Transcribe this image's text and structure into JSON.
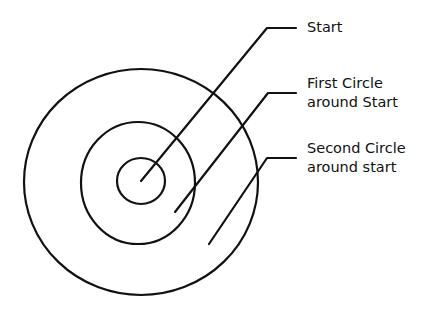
{
  "diagram": {
    "type": "concentric-circles",
    "stroke_color": "#111111",
    "circles": [
      {
        "name": "outer",
        "cx": 141,
        "cy": 182,
        "rx": 117,
        "ry": 113
      },
      {
        "name": "middle",
        "cx": 138,
        "cy": 183,
        "rx": 57,
        "ry": 61
      },
      {
        "name": "inner",
        "cx": 141,
        "cy": 181,
        "rx": 24,
        "ry": 23
      }
    ],
    "labels": [
      {
        "id": "start",
        "lines": [
          "Start"
        ]
      },
      {
        "id": "first",
        "lines": [
          "First Circle",
          "around Start"
        ]
      },
      {
        "id": "second",
        "lines": [
          "Second Circle",
          "around start"
        ]
      }
    ]
  }
}
